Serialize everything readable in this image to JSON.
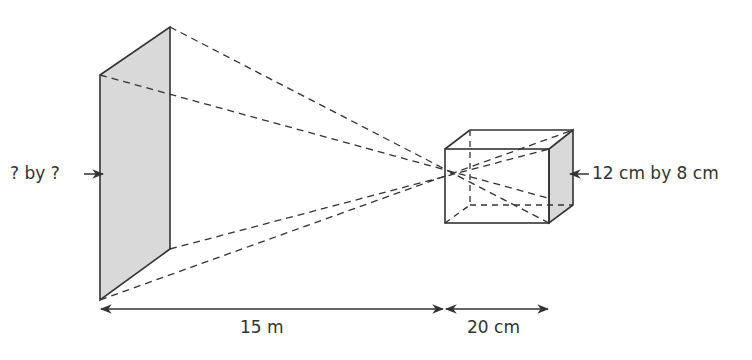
{
  "labels": {
    "screen_size": "? by ?",
    "object_size": "12 cm by 8 cm",
    "distance_screen": "15 m",
    "distance_object": "20 cm"
  },
  "colors": {
    "line": "#333333",
    "shade": "#d9d9d9"
  }
}
